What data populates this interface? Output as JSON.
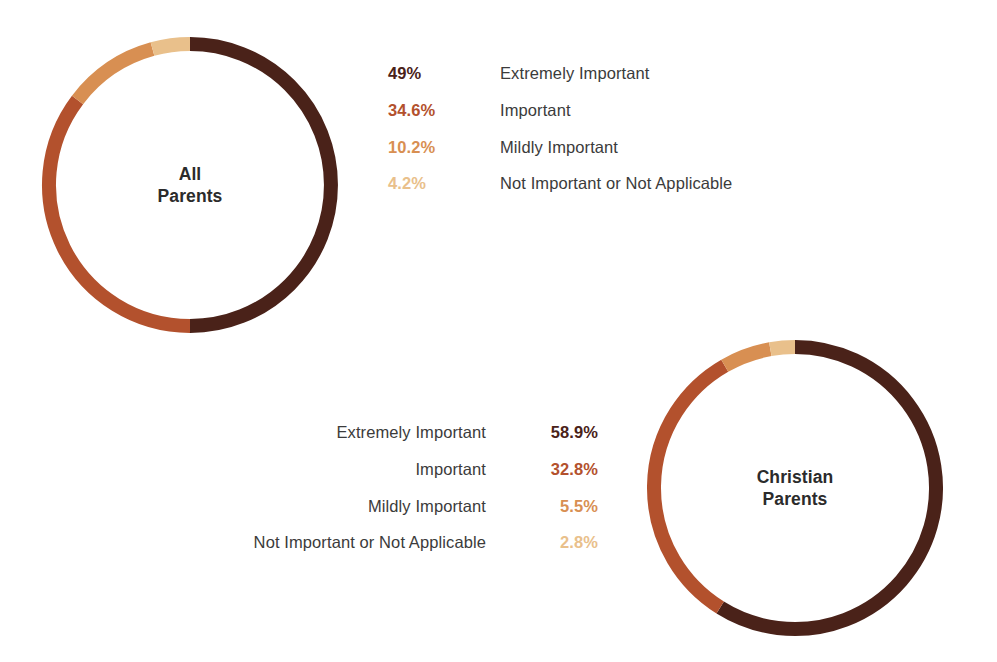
{
  "palette": {
    "extremely_important": "#4a2219",
    "important": "#b3512d",
    "mildly_important": "#d88f52",
    "not_important": "#e9c08b",
    "label_text": "#3b3b3b",
    "center_text": "#2b2b2b",
    "background": "#ffffff"
  },
  "donuts": {
    "all_parents": {
      "center_label_line1": "All",
      "center_label_line2": "Parents"
    },
    "christian_parents": {
      "center_label_line1": "Christian",
      "center_label_line2": "Parents"
    }
  },
  "legends": {
    "all_parents": [
      {
        "value": "49%",
        "label": "Extremely Important",
        "color": "#4a2219"
      },
      {
        "value": "34.6%",
        "label": "Important",
        "color": "#b3512d"
      },
      {
        "value": "10.2%",
        "label": "Mildly Important",
        "color": "#d88f52"
      },
      {
        "value": "4.2%",
        "label": "Not Important or Not Applicable",
        "color": "#e9c08b"
      }
    ],
    "christian_parents": [
      {
        "value": "58.9%",
        "label": "Extremely Important",
        "color": "#4a2219"
      },
      {
        "value": "32.8%",
        "label": "Important",
        "color": "#b3512d"
      },
      {
        "value": "5.5%",
        "label": "Mildly Important",
        "color": "#d88f52"
      },
      {
        "value": "2.8%",
        "label": "Not Important or Not Applicable",
        "color": "#e9c08b"
      }
    ]
  },
  "chart_data": [
    {
      "type": "pie",
      "title": "All Parents",
      "subtitle": "",
      "variant": "donut",
      "start_angle_deg": 0,
      "direction": "clockwise",
      "legend_position": "right",
      "grid": false,
      "xlabel": "",
      "ylabel": "",
      "categories": [
        "Extremely Important",
        "Important",
        "Mildly Important",
        "Not Important or Not Applicable"
      ],
      "values": [
        49,
        34.6,
        10.2,
        4.2
      ],
      "value_labels": [
        "49%",
        "34.6%",
        "10.2%",
        "4.2%"
      ],
      "colors": [
        "#4a2219",
        "#b3512d",
        "#d88f52",
        "#e9c08b"
      ]
    },
    {
      "type": "pie",
      "title": "Christian Parents",
      "subtitle": "",
      "variant": "donut",
      "start_angle_deg": 0,
      "direction": "clockwise",
      "legend_position": "left",
      "grid": false,
      "xlabel": "",
      "ylabel": "",
      "categories": [
        "Extremely Important",
        "Important",
        "Mildly Important",
        "Not Important or Not Applicable"
      ],
      "values": [
        58.9,
        32.8,
        5.5,
        2.8
      ],
      "value_labels": [
        "58.9%",
        "32.8%",
        "5.5%",
        "2.8%"
      ],
      "colors": [
        "#4a2219",
        "#b3512d",
        "#d88f52",
        "#e9c08b"
      ]
    }
  ]
}
